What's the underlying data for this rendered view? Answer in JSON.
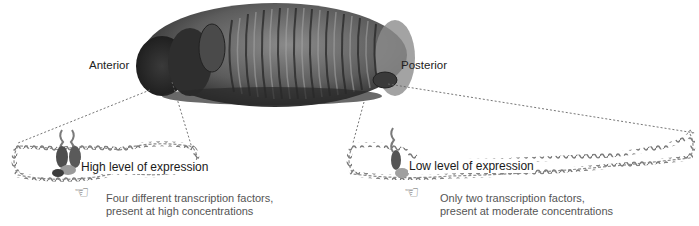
{
  "figure": {
    "embryo": {
      "anterior_label": "Anterior",
      "posterior_label": "Posterior"
    },
    "left_panel": {
      "expression_label": "High level of expression",
      "note_line1": "Four different transcription factors,",
      "note_line2": "present at high concentrations",
      "transcription_factor_count": 4,
      "pointer_icon": "☜"
    },
    "right_panel": {
      "expression_label": "Low level of expression",
      "note_line1": "Only two transcription factors,",
      "note_line2": "present at moderate concentrations",
      "transcription_factor_count": 2,
      "pointer_icon": "☜"
    },
    "colors": {
      "embryo_dark": "#2a2a2a",
      "embryo_mid": "#6e6e6e",
      "embryo_light": "#b5b5b5",
      "dna": "#8a8a8a",
      "dna_light": "#c8c8c8",
      "protein": "#5a5a5a",
      "dashed_line": "#666666"
    }
  }
}
